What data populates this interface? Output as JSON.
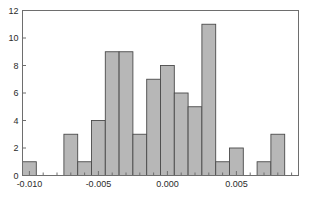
{
  "chart_data": {
    "type": "bar",
    "subtype": "histogram",
    "title": "",
    "xlabel": "",
    "ylabel": "",
    "xlim": [
      -0.0105,
      0.0095
    ],
    "ylim": [
      0,
      12
    ],
    "grid": false,
    "legend": null,
    "bin_width": 0.001,
    "bar_fill_color": "#b7b7b7",
    "bar_edge_color": "#4a4a4a",
    "axis_color": "#6e6e6e",
    "text_color": "#2b2b2b",
    "x_tick_values": [
      -0.01,
      -0.005,
      0.0,
      0.005
    ],
    "x_tick_labels": [
      "-0.010",
      "-0.005",
      "0.000",
      "0.005"
    ],
    "x_minor_tick_values": [
      -0.009,
      -0.008,
      -0.007,
      -0.006,
      -0.004,
      -0.003,
      -0.002,
      -0.001,
      0.001,
      0.002,
      0.003,
      0.004,
      0.006,
      0.007,
      0.008,
      0.009
    ],
    "y_tick_values": [
      0,
      2,
      4,
      6,
      8,
      10,
      12
    ],
    "y_tick_labels": [
      "0",
      "2",
      "4",
      "6",
      "8",
      "10",
      "12"
    ],
    "bin_edges": [
      -0.0105,
      -0.0095,
      -0.0085,
      -0.0075,
      -0.0065,
      -0.0055,
      -0.0045,
      -0.0035,
      -0.0025,
      -0.0015,
      -0.0005,
      0.0005,
      0.0015,
      0.0025,
      0.0035,
      0.0045,
      0.0055,
      0.0065,
      0.0075,
      0.0085,
      0.0095
    ],
    "bin_centers": [
      -0.01,
      -0.009,
      -0.008,
      -0.007,
      -0.006,
      -0.005,
      -0.004,
      -0.003,
      -0.002,
      -0.001,
      0.0,
      0.001,
      0.002,
      0.003,
      0.004,
      0.005,
      0.006,
      0.007,
      0.008,
      0.009
    ],
    "categories": [
      "-0.010",
      "-0.009",
      "-0.008",
      "-0.007",
      "-0.006",
      "-0.005",
      "-0.004",
      "-0.003",
      "-0.002",
      "-0.001",
      "0.000",
      "0.001",
      "0.002",
      "0.003",
      "0.004",
      "0.005",
      "0.006",
      "0.007",
      "0.008",
      "0.009"
    ],
    "values": [
      1,
      0,
      0,
      3,
      1,
      4,
      9,
      9,
      3,
      7,
      8,
      6,
      5,
      11,
      1,
      2,
      0,
      1,
      3,
      0
    ],
    "total_count": 64
  }
}
